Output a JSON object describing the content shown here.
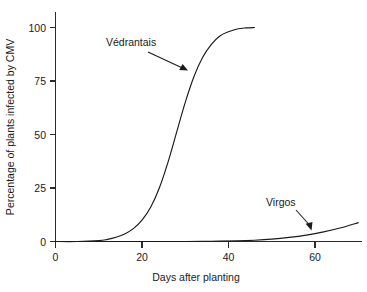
{
  "chart_data": {
    "type": "line",
    "title": "",
    "xlabel": "Days after planting",
    "ylabel": "Percentage of plants infected by CMV",
    "xlim": [
      0,
      71
    ],
    "ylim": [
      0,
      105
    ],
    "xticks": [
      0,
      20,
      40,
      60
    ],
    "xtick_labels": [
      "0",
      "20",
      "40",
      "60"
    ],
    "yticks": [
      0,
      25,
      50,
      75,
      100
    ],
    "ytick_labels": [
      "0",
      "25",
      "50",
      "75",
      "100"
    ],
    "grid": false,
    "legend_position": "inline-annotations",
    "series": [
      {
        "name": "Védrantais",
        "label": "Védrantais",
        "x": [
          0,
          5,
          10,
          12,
          14,
          16,
          18,
          20,
          22,
          24,
          26,
          28,
          30,
          32,
          34,
          36,
          38,
          40,
          42,
          44,
          46
        ],
        "values": [
          0,
          0,
          0.4,
          1,
          2,
          3.5,
          6,
          10,
          16,
          25,
          37,
          51,
          65,
          77,
          86,
          92,
          96,
          98,
          99.3,
          99.8,
          100
        ]
      },
      {
        "name": "Virgos",
        "label": "Virgos",
        "x": [
          0,
          10,
          20,
          30,
          36,
          42,
          46,
          50,
          54,
          58,
          62,
          66,
          70
        ],
        "values": [
          0,
          0,
          0,
          0,
          0.1,
          0.3,
          0.6,
          1.1,
          1.9,
          3.0,
          4.5,
          6.4,
          8.8
        ]
      }
    ],
    "annotations": [
      {
        "text": "Védrantais",
        "target_series": "Védrantais",
        "target_x": 30,
        "target_y": 80
      },
      {
        "text": "Virgos",
        "target_series": "Virgos",
        "target_x": 59,
        "target_y": 5
      }
    ]
  },
  "axes": {
    "x_title": "Days after planting",
    "y_title": "Percentage of plants infected by CMV",
    "x_tick_labels": [
      "0",
      "20",
      "40",
      "60"
    ],
    "y_tick_labels": [
      "0",
      "25",
      "50",
      "75",
      "100"
    ]
  },
  "labels": {
    "vedrantais": "Védrantais",
    "virgos": "Virgos"
  },
  "colors": {
    "background": "#ffffff",
    "line": "#1a1a1a",
    "axis": "#2b2b2b"
  }
}
